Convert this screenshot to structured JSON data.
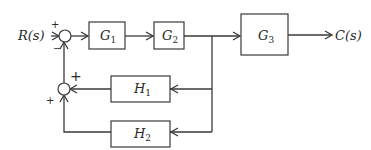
{
  "diagram": {
    "type": "block-diagram",
    "input": {
      "label": "R(s)"
    },
    "output": {
      "label": "C(s)"
    },
    "blocks": [
      {
        "id": "G1",
        "base": "G",
        "sub": "1"
      },
      {
        "id": "G2",
        "base": "G",
        "sub": "2"
      },
      {
        "id": "G3",
        "base": "G",
        "sub": "3"
      },
      {
        "id": "H1",
        "base": "H",
        "sub": "1"
      },
      {
        "id": "H2",
        "base": "H",
        "sub": "2"
      }
    ],
    "summing_junctions": [
      {
        "id": "S1",
        "signs": {
          "top": "+",
          "bottom": "−"
        }
      },
      {
        "id": "S2",
        "signs": {
          "right": "+",
          "bottom": "+"
        }
      }
    ],
    "connections": [
      "R(s) → S1 (+)",
      "S1 → G1",
      "G1 → G2",
      "G2 → branch point",
      "branch point → G3",
      "G3 → C(s)",
      "branch point → H1",
      "branch point → H2",
      "H1 → S2 (+)",
      "H2 → S2 (+)",
      "S2 → S1 (−)"
    ]
  }
}
